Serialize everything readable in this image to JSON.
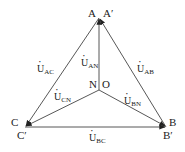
{
  "diagram": {
    "type": "three-phase voltage phasor diagram",
    "nodes": [
      {
        "id": "A",
        "label": "A",
        "x": 99,
        "y": 18
      },
      {
        "id": "A'",
        "label": "A′",
        "x": 99,
        "y": 18
      },
      {
        "id": "B",
        "label": "B",
        "x": 166,
        "y": 127
      },
      {
        "id": "B'",
        "label": "B′",
        "x": 166,
        "y": 127
      },
      {
        "id": "C",
        "label": "C",
        "x": 25,
        "y": 127
      },
      {
        "id": "C'",
        "label": "C′",
        "x": 25,
        "y": 127
      },
      {
        "id": "N",
        "label": "N",
        "x": 99,
        "y": 90
      },
      {
        "id": "O",
        "label": "O",
        "x": 99,
        "y": 90
      }
    ],
    "vectors": [
      {
        "name": "U_AN",
        "main": "U",
        "sub": "AN",
        "from": "N",
        "to": "A"
      },
      {
        "name": "U_BN",
        "main": "U",
        "sub": "BN",
        "from": "N",
        "to": "B"
      },
      {
        "name": "U_CN",
        "main": "U",
        "sub": "CN",
        "from": "N",
        "to": "C"
      },
      {
        "name": "U_AB",
        "main": "U",
        "sub": "AB",
        "from": "B",
        "to": "A"
      },
      {
        "name": "U_BC",
        "main": "U",
        "sub": "BC",
        "from": "C",
        "to": "B"
      },
      {
        "name": "U_AC",
        "main": "U",
        "sub": "AC",
        "from": "A",
        "to": "C"
      }
    ]
  },
  "labels": {
    "A": "A",
    "A_prime": "A′",
    "B": "B",
    "B_prime": "B′",
    "C": "C",
    "C_prime": "C′",
    "N": "N",
    "O": "O",
    "U": "U",
    "sub_AN": "AN",
    "sub_BN": "BN",
    "sub_CN": "CN",
    "sub_AB": "AB",
    "sub_BC": "BC",
    "sub_AC": "AC"
  }
}
